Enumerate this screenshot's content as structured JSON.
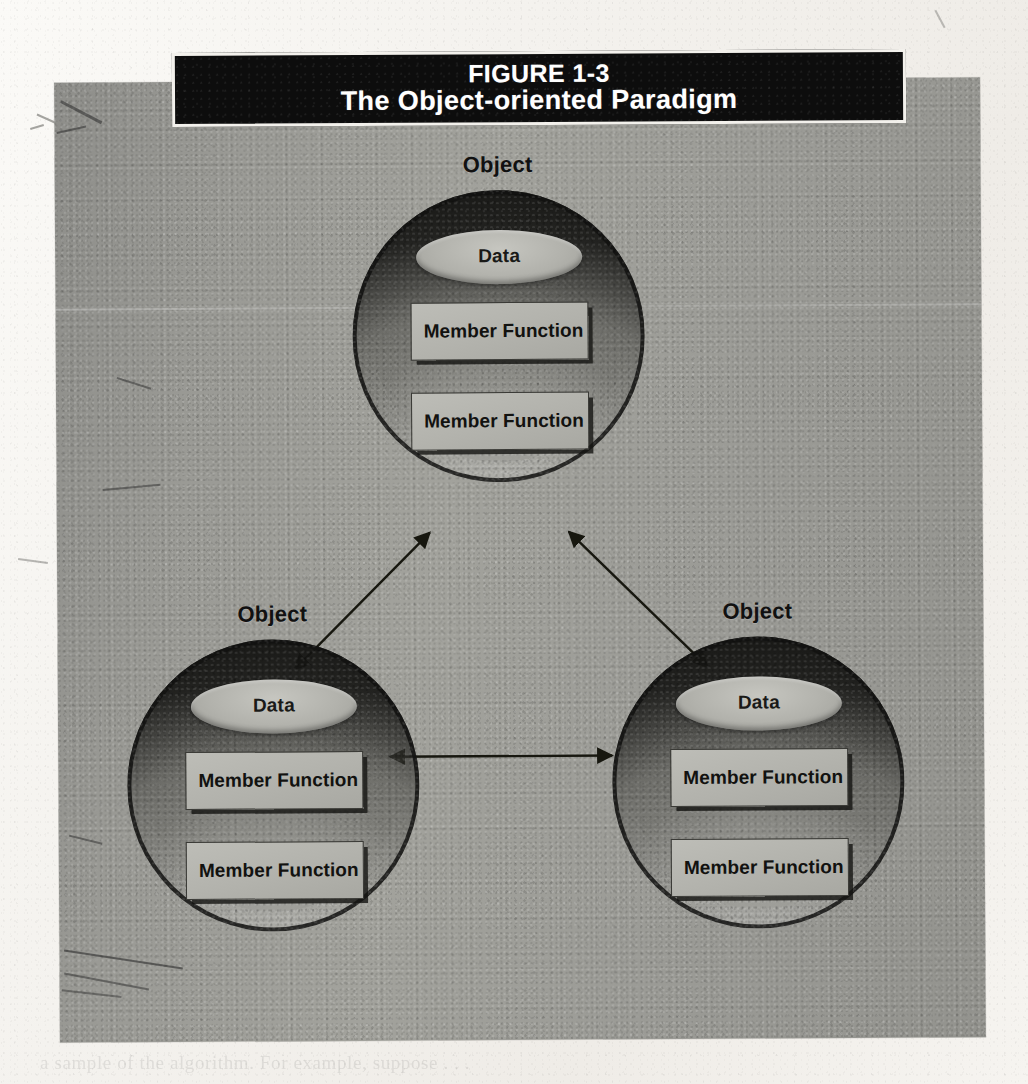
{
  "figure": {
    "number": "FIGURE 1-3",
    "caption": "The Object-oriented Paradigm",
    "type": "diagram",
    "colors": {
      "panel_background": "#9a9a95",
      "title_band": "#0d0d0d",
      "title_text": "#ffffff",
      "sphere_dark": "#141410",
      "box_fill": "#b2b2ac",
      "ink": "#121210",
      "page": "#f4f2ee"
    }
  },
  "objects": [
    {
      "id": "top",
      "label": "Object",
      "data_label": "Data",
      "members": [
        "Member Function",
        "Member Function"
      ]
    },
    {
      "id": "left",
      "label": "Object",
      "data_label": "Data",
      "members": [
        "Member Function",
        "Member Function"
      ]
    },
    {
      "id": "right",
      "label": "Object",
      "data_label": "Data",
      "members": [
        "Member Function",
        "Member Function"
      ]
    }
  ],
  "connections": [
    {
      "id": "top-left",
      "from": "top",
      "to": "left",
      "style": "double-headed-arrow"
    },
    {
      "id": "top-right",
      "from": "top",
      "to": "right",
      "style": "double-headed-arrow"
    },
    {
      "id": "left-right",
      "from": "left",
      "to": "right",
      "style": "double-headed-arrow"
    }
  ],
  "page": {
    "bleed_through": "a sample of the algorithm. For example, suppose . . ."
  }
}
